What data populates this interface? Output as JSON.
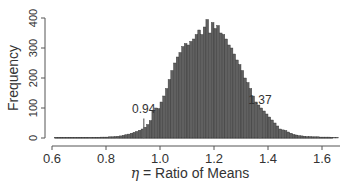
{
  "chart_data": {
    "type": "bar",
    "title": "",
    "xlabel": "η = Ratio of Means",
    "xlabel_symbol": "η",
    "xlabel_text": " = Ratio of Means",
    "ylabel": "Frequency",
    "xlim": [
      0.6,
      1.65
    ],
    "ylim": [
      0,
      400
    ],
    "x_ticks": [
      0.6,
      0.8,
      1.0,
      1.2,
      1.4,
      1.6
    ],
    "x_tick_labels": [
      "0.6",
      "0.8",
      "1.0",
      "1.2",
      "1.4",
      "1.6"
    ],
    "y_ticks": [
      0,
      100,
      200,
      300,
      400
    ],
    "y_tick_labels": [
      "0",
      "100",
      "200",
      "300",
      "400"
    ],
    "grid": false,
    "legend": null,
    "bin_width": 0.01,
    "bin_start": 0.61,
    "values": [
      2,
      2,
      2,
      2,
      2,
      2,
      2,
      2,
      2,
      2,
      2,
      2,
      2,
      2,
      2,
      2,
      2,
      3,
      3,
      3,
      4,
      4,
      5,
      6,
      7,
      9,
      11,
      13,
      16,
      19,
      22,
      26,
      30,
      36,
      45,
      58,
      90,
      100,
      98,
      120,
      140,
      165,
      195,
      225,
      250,
      270,
      285,
      305,
      315,
      310,
      322,
      330,
      345,
      360,
      345,
      370,
      395,
      350,
      385,
      365,
      375,
      350,
      345,
      330,
      310,
      300,
      280,
      260,
      245,
      225,
      200,
      185,
      165,
      140,
      120,
      110,
      100,
      90,
      80,
      70,
      60,
      50,
      40,
      30,
      27,
      25,
      20,
      16,
      12,
      10,
      8,
      7,
      6,
      5,
      5,
      4,
      4,
      4,
      3,
      3,
      3,
      3,
      2,
      2,
      2
    ],
    "annotations": [
      {
        "label": "0.94",
        "x": 0.94,
        "line_top": 65,
        "line_bottom": 0
      },
      {
        "label": "1.37",
        "x": 1.37,
        "line_top": 95,
        "line_bottom": 0
      }
    ],
    "bar_color": "#606060",
    "bar_edge_color": "#333333"
  }
}
